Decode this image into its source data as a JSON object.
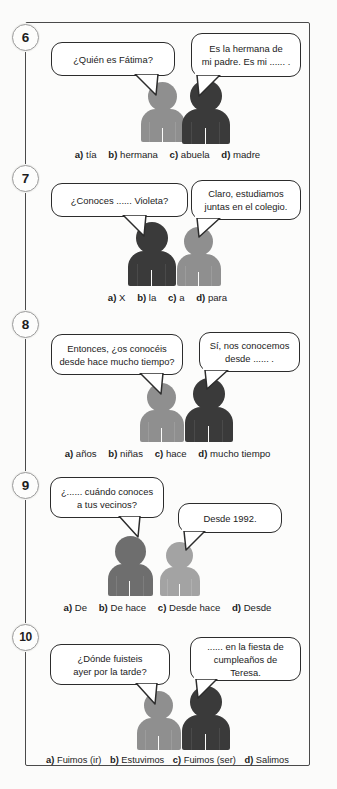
{
  "page": {
    "frame_border_color": "#4a4a4a",
    "background_color": "#fbfbfa"
  },
  "colors": {
    "figure_light": "#8f8f8f",
    "figure_mid": "#6e6e6e",
    "figure_dark": "#3a3a3a",
    "bubble_outline": "#2c2c2c",
    "text": "#1b1b1b"
  },
  "exercises": [
    {
      "number": "6",
      "bubbles": [
        {
          "text": "¿Quién es Fátima?",
          "lines": [
            "¿Quién es Fátima?"
          ]
        },
        {
          "text": "Es la hermana de mi padre. Es mi ...... .",
          "lines": [
            "Es la hermana de",
            "mi padre. Es mi ...... ."
          ]
        }
      ],
      "figures": [
        {
          "shade": "light"
        },
        {
          "shade": "dark"
        }
      ],
      "options": [
        {
          "letter": "a)",
          "answer": "tía"
        },
        {
          "letter": "b)",
          "answer": "hermana"
        },
        {
          "letter": "c)",
          "answer": "abuela"
        },
        {
          "letter": "d)",
          "answer": "madre"
        }
      ]
    },
    {
      "number": "7",
      "bubbles": [
        {
          "text": "¿Conoces ...... Violeta?",
          "lines": [
            "¿Conoces ...... Violeta?"
          ]
        },
        {
          "text": "Claro, estudiamos juntas en el colegio.",
          "lines": [
            "Claro, estudiamos",
            "juntas en el colegio."
          ]
        }
      ],
      "figures": [
        {
          "shade": "dark"
        },
        {
          "shade": "light"
        }
      ],
      "options": [
        {
          "letter": "a)",
          "answer": "X"
        },
        {
          "letter": "b)",
          "answer": "la"
        },
        {
          "letter": "c)",
          "answer": "a"
        },
        {
          "letter": "d)",
          "answer": "para"
        }
      ]
    },
    {
      "number": "8",
      "bubbles": [
        {
          "text": "Entonces, ¿os conocéis desde hace mucho tiempo?",
          "lines": [
            "Entonces, ¿os conocéis",
            "desde hace mucho tiempo?"
          ]
        },
        {
          "text": "Sí, nos conocemos desde ...... .",
          "lines": [
            "Sí, nos conocemos",
            "desde ...... ."
          ]
        }
      ],
      "figures": [
        {
          "shade": "light"
        },
        {
          "shade": "dark"
        }
      ],
      "options": [
        {
          "letter": "a)",
          "answer": "años"
        },
        {
          "letter": "b)",
          "answer": "niñas"
        },
        {
          "letter": "c)",
          "answer": "hace"
        },
        {
          "letter": "d)",
          "answer": "mucho tiempo"
        }
      ]
    },
    {
      "number": "9",
      "bubbles": [
        {
          "text": "¿...... cuándo conoces a tus vecinos?",
          "lines": [
            "¿...... cuándo conoces",
            "a tus vecinos?"
          ]
        },
        {
          "text": "Desde 1992.",
          "lines": [
            "Desde 1992."
          ]
        }
      ],
      "figures": [
        {
          "shade": "mid"
        },
        {
          "shade": "light"
        }
      ],
      "options": [
        {
          "letter": "a)",
          "answer": "De"
        },
        {
          "letter": "b)",
          "answer": "De hace"
        },
        {
          "letter": "c)",
          "answer": "Desde hace"
        },
        {
          "letter": "d)",
          "answer": "Desde"
        }
      ]
    },
    {
      "number": "10",
      "bubbles": [
        {
          "text": "¿Dónde fuisteis ayer por la tarde?",
          "lines": [
            "¿Dónde fuisteis",
            "ayer por la tarde?"
          ]
        },
        {
          "text": "...... en la fiesta de cumpleaños de Teresa.",
          "lines": [
            "...... en la fiesta de",
            "cumpleaños de Teresa."
          ]
        }
      ],
      "figures": [
        {
          "shade": "light"
        },
        {
          "shade": "dark"
        }
      ],
      "options": [
        {
          "letter": "a)",
          "answer": "Fuimos (ir)"
        },
        {
          "letter": "b)",
          "answer": "Estuvimos"
        },
        {
          "letter": "c)",
          "answer": "Fuimos (ser)"
        },
        {
          "letter": "d)",
          "answer": "Salimos"
        }
      ]
    }
  ]
}
